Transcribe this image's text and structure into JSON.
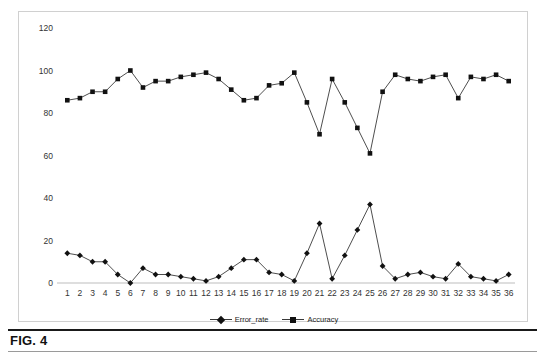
{
  "figure": {
    "caption_label": "FIG. 4",
    "accent_color": "#111111",
    "line_color": "#3a3a3a",
    "frame_color": "#d0d0d0"
  },
  "legend": {
    "position": "bottom-center",
    "items": [
      {
        "label": "Error_rate",
        "marker": "diamond",
        "color": "#111111"
      },
      {
        "label": "Accuracy",
        "marker": "square",
        "color": "#111111"
      }
    ]
  },
  "chart_data": {
    "type": "line",
    "title": "",
    "subtitle": "",
    "xlabel": "",
    "ylabel": "",
    "grid": false,
    "legend_position": "bottom-center",
    "ylim": [
      0,
      120
    ],
    "yticks": [
      0,
      20,
      40,
      60,
      80,
      100,
      120
    ],
    "ytick_labels": [
      "0",
      "20",
      "40",
      "60",
      "80",
      "100",
      "120"
    ],
    "categories": [
      "1",
      "2",
      "3",
      "4",
      "5",
      "6",
      "7",
      "8",
      "9",
      "10",
      "11",
      "12",
      "13",
      "14",
      "15",
      "16",
      "17",
      "18",
      "19",
      "20",
      "21",
      "22",
      "23",
      "24",
      "25",
      "26",
      "27",
      "28",
      "29",
      "30",
      "31",
      "32",
      "33",
      "34",
      "35",
      "36"
    ],
    "series": [
      {
        "name": "Error_rate",
        "marker": "diamond",
        "color": "#111111",
        "values": [
          14,
          13,
          10,
          10,
          4,
          0,
          7,
          4,
          4,
          3,
          2,
          1,
          3,
          7,
          11,
          11,
          5,
          4,
          1,
          14,
          28,
          2,
          13,
          25,
          37,
          8,
          2,
          4,
          5,
          3,
          2,
          9,
          3,
          2,
          1,
          4
        ]
      },
      {
        "name": "Accuracy",
        "marker": "square",
        "color": "#111111",
        "values": [
          86,
          87,
          90,
          90,
          96,
          100,
          92,
          95,
          95,
          97,
          98,
          99,
          96,
          91,
          86,
          87,
          93,
          94,
          99,
          85,
          70,
          96,
          85,
          73,
          61,
          90,
          98,
          96,
          95,
          97,
          98,
          87,
          97,
          96,
          98,
          95
        ]
      }
    ]
  }
}
